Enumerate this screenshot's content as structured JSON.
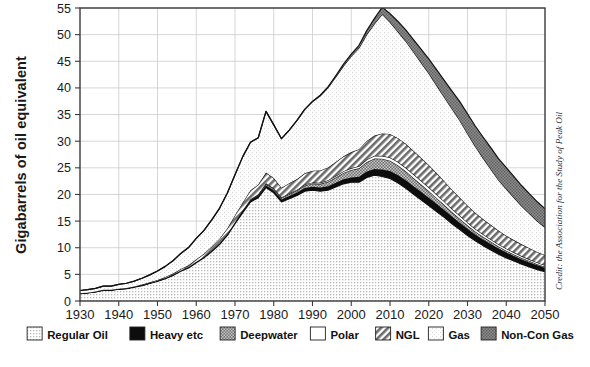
{
  "chart_data": {
    "type": "area",
    "title": "",
    "subtitle": "",
    "xlabel": "",
    "ylabel": "Gigabarrels of oil equivalent",
    "xlim": [
      1930,
      2050
    ],
    "ylim": [
      0,
      55
    ],
    "ytick_step": 5,
    "xtick_step": 10,
    "grid": true,
    "stacked": true,
    "legend_position": "bottom",
    "credit": "Credit: the Association for the Study of Peak Oil",
    "yticks": [
      "0",
      "5",
      "10",
      "15",
      "20",
      "25",
      "30",
      "35",
      "40",
      "45",
      "50",
      "55"
    ],
    "xticks": [
      "1930",
      "1940",
      "1950",
      "1960",
      "1970",
      "1980",
      "1990",
      "2000",
      "2010",
      "2020",
      "2030",
      "2040",
      "2050"
    ],
    "x": [
      1930,
      1932,
      1934,
      1936,
      1938,
      1940,
      1942,
      1944,
      1946,
      1948,
      1950,
      1952,
      1954,
      1956,
      1958,
      1960,
      1962,
      1964,
      1966,
      1968,
      1970,
      1972,
      1974,
      1976,
      1978,
      1980,
      1982,
      1984,
      1986,
      1988,
      1990,
      1992,
      1994,
      1996,
      1998,
      2000,
      2002,
      2004,
      2006,
      2008,
      2010,
      2012,
      2014,
      2016,
      2018,
      2020,
      2022,
      2024,
      2026,
      2028,
      2030,
      2032,
      2034,
      2036,
      2038,
      2040,
      2042,
      2044,
      2046,
      2048,
      2050
    ],
    "series": [
      {
        "name": "Regular Oil",
        "pattern": "fine-dots",
        "color": "#e4e4e4",
        "values": [
          1.4,
          1.5,
          1.7,
          2.0,
          2.0,
          2.2,
          2.3,
          2.6,
          2.9,
          3.3,
          3.7,
          4.2,
          4.8,
          5.6,
          6.2,
          7.2,
          8.1,
          9.3,
          10.6,
          12.3,
          14.5,
          16.6,
          18.6,
          19.4,
          21.3,
          20.3,
          18.6,
          19.2,
          19.8,
          20.6,
          20.8,
          20.6,
          20.8,
          21.4,
          22.0,
          22.3,
          22.3,
          23.2,
          23.6,
          23.4,
          23.0,
          22.2,
          21.2,
          20.1,
          19.0,
          17.9,
          16.8,
          15.7,
          14.5,
          13.4,
          12.3,
          11.3,
          10.4,
          9.6,
          8.8,
          8.1,
          7.5,
          6.9,
          6.4,
          5.9,
          5.5
        ]
      },
      {
        "name": "Heavy etc",
        "pattern": "solid-black",
        "color": "#0d0d0d",
        "values": [
          0.05,
          0.05,
          0.05,
          0.06,
          0.06,
          0.06,
          0.07,
          0.07,
          0.08,
          0.08,
          0.09,
          0.1,
          0.11,
          0.12,
          0.13,
          0.15,
          0.16,
          0.18,
          0.2,
          0.22,
          0.25,
          0.3,
          0.35,
          0.4,
          0.45,
          0.45,
          0.45,
          0.5,
          0.55,
          0.6,
          0.65,
          0.7,
          0.75,
          0.8,
          0.85,
          0.9,
          1.0,
          1.1,
          1.2,
          1.3,
          1.4,
          1.45,
          1.5,
          1.5,
          1.5,
          1.5,
          1.45,
          1.4,
          1.35,
          1.3,
          1.25,
          1.2,
          1.15,
          1.1,
          1.05,
          1.0,
          0.95,
          0.9,
          0.85,
          0.8,
          0.75
        ]
      },
      {
        "name": "Deepwater",
        "pattern": "dark-mesh",
        "color": "#8a8a8a",
        "values": [
          0,
          0,
          0,
          0,
          0,
          0,
          0,
          0,
          0,
          0,
          0,
          0,
          0,
          0,
          0,
          0,
          0,
          0,
          0,
          0,
          0.05,
          0.1,
          0.15,
          0.2,
          0.25,
          0.3,
          0.3,
          0.35,
          0.4,
          0.5,
          0.6,
          0.7,
          0.85,
          1.0,
          1.2,
          1.4,
          1.6,
          1.8,
          1.95,
          2.0,
          1.95,
          1.85,
          1.7,
          1.55,
          1.4,
          1.25,
          1.1,
          0.95,
          0.85,
          0.75,
          0.65,
          0.55,
          0.5,
          0.45,
          0.4,
          0.35,
          0.3,
          0.28,
          0.25,
          0.22,
          0.2
        ]
      },
      {
        "name": "Polar",
        "pattern": "white",
        "color": "#ffffff",
        "values": [
          0,
          0,
          0,
          0,
          0,
          0,
          0,
          0,
          0,
          0,
          0,
          0,
          0,
          0,
          0,
          0,
          0,
          0,
          0,
          0,
          0,
          0,
          0,
          0.05,
          0.1,
          0.12,
          0.12,
          0.14,
          0.15,
          0.17,
          0.2,
          0.22,
          0.25,
          0.28,
          0.3,
          0.35,
          0.4,
          0.45,
          0.5,
          0.55,
          0.6,
          0.62,
          0.65,
          0.68,
          0.7,
          0.7,
          0.68,
          0.65,
          0.6,
          0.58,
          0.55,
          0.5,
          0.48,
          0.45,
          0.42,
          0.4,
          0.38,
          0.35,
          0.32,
          0.3,
          0.28
        ]
      },
      {
        "name": "NGL",
        "pattern": "diagonal-hatch",
        "color": "#9c9c9c",
        "values": [
          0.02,
          0.02,
          0.03,
          0.03,
          0.04,
          0.05,
          0.06,
          0.07,
          0.1,
          0.12,
          0.15,
          0.2,
          0.25,
          0.3,
          0.4,
          0.5,
          0.6,
          0.75,
          0.9,
          1.1,
          1.3,
          1.5,
          1.7,
          1.8,
          2.0,
          1.9,
          1.8,
          1.9,
          2.0,
          2.1,
          2.2,
          2.3,
          2.4,
          2.6,
          2.8,
          3.0,
          3.2,
          3.5,
          3.8,
          4.2,
          4.4,
          4.5,
          4.5,
          4.4,
          4.3,
          4.2,
          4.0,
          3.8,
          3.6,
          3.4,
          3.2,
          3.0,
          2.85,
          2.7,
          2.55,
          2.4,
          2.3,
          2.2,
          2.1,
          2.0,
          1.9
        ]
      },
      {
        "name": "Gas",
        "pattern": "very-fine-dots",
        "color": "#f2f2f2",
        "values": [
          0.5,
          0.55,
          0.6,
          0.7,
          0.7,
          0.8,
          0.9,
          1.0,
          1.2,
          1.4,
          1.7,
          2.0,
          2.4,
          2.9,
          3.3,
          3.9,
          4.4,
          5.0,
          5.7,
          6.6,
          7.6,
          8.6,
          9.0,
          8.8,
          11.5,
          10.0,
          9.2,
          10.0,
          11.0,
          12.0,
          13.0,
          14.0,
          15.0,
          16.0,
          17.0,
          18.0,
          19.0,
          20.0,
          21.0,
          22.4,
          21.0,
          20.0,
          19.3,
          18.6,
          17.9,
          17.2,
          16.5,
          15.8,
          15.2,
          14.5,
          13.5,
          12.5,
          11.5,
          10.5,
          9.5,
          8.8,
          8.0,
          7.2,
          6.5,
          5.8,
          5.2
        ]
      },
      {
        "name": "Non-Con Gas",
        "pattern": "gray-mesh",
        "color": "#757575",
        "values": [
          0,
          0,
          0,
          0,
          0,
          0,
          0,
          0,
          0,
          0,
          0,
          0,
          0,
          0,
          0,
          0,
          0,
          0,
          0,
          0,
          0,
          0,
          0,
          0,
          0,
          0,
          0,
          0,
          0,
          0,
          0,
          0.1,
          0.15,
          0.2,
          0.3,
          0.4,
          0.5,
          0.7,
          1.0,
          1.3,
          1.6,
          1.9,
          2.1,
          2.3,
          2.5,
          2.7,
          2.9,
          3.1,
          3.3,
          3.5,
          3.7,
          3.8,
          3.9,
          4.0,
          4.0,
          4.0,
          3.9,
          3.8,
          3.7,
          3.6,
          3.5
        ]
      }
    ]
  },
  "axes": {
    "ylabel": "Gigabarrels of oil equivalent",
    "yticks": [
      "55",
      "50",
      "45",
      "40",
      "35",
      "30",
      "25",
      "20",
      "15",
      "10",
      "5",
      "0"
    ],
    "xticks": [
      "1930",
      "1940",
      "1950",
      "1960",
      "1970",
      "1980",
      "1990",
      "2000",
      "2010",
      "2020",
      "2030",
      "2040",
      "2050"
    ]
  },
  "credit": {
    "text": "Credit: the Association for the Study of Peak Oil"
  },
  "legend": {
    "items": [
      {
        "label": "Regular Oil",
        "swatch": "regular-oil"
      },
      {
        "label": "Heavy etc",
        "swatch": "heavy-etc"
      },
      {
        "label": "Deepwater",
        "swatch": "deepwater"
      },
      {
        "label": "Polar",
        "swatch": "polar"
      },
      {
        "label": "NGL",
        "swatch": "ngl"
      },
      {
        "label": "Gas",
        "swatch": "gas"
      },
      {
        "label": "Non-Con Gas",
        "swatch": "non-con-gas"
      }
    ]
  }
}
